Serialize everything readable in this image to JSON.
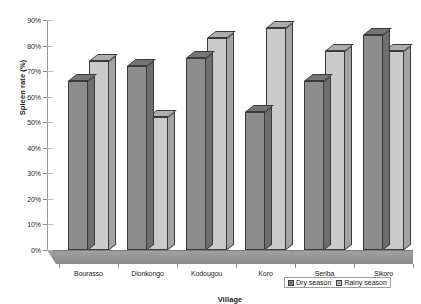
{
  "chart_data": {
    "type": "bar",
    "title": "",
    "xlabel": "Village",
    "ylabel": "Spleen rate (%)",
    "categories": [
      "Bourasso",
      "Dionkongo",
      "Kodougou",
      "Koro",
      "Seriba",
      "Sikoro"
    ],
    "series": [
      {
        "name": "Dry season",
        "values": [
          66,
          72,
          75,
          54,
          66,
          84
        ],
        "color": "#8d8d8d"
      },
      {
        "name": "Rainy season",
        "values": [
          74,
          52,
          83,
          87,
          78,
          78
        ],
        "color": "#cacaca"
      }
    ],
    "ylim": [
      0,
      90
    ],
    "ytick_labels": [
      "0%",
      "10%",
      "20%",
      "30%",
      "40%",
      "50%",
      "60%",
      "70%",
      "80%",
      "90%"
    ],
    "ytick_values": [
      0,
      10,
      20,
      30,
      40,
      50,
      60,
      70,
      80,
      90
    ],
    "grid": false,
    "legend_position": "bottom-right",
    "style": "3d-grouped-bar-grayscale"
  },
  "legend": {
    "items": [
      {
        "label": "Dry season",
        "marker": "legend-swatch-dry"
      },
      {
        "label": "Rainy season",
        "marker": "legend-swatch-rainy"
      }
    ]
  }
}
